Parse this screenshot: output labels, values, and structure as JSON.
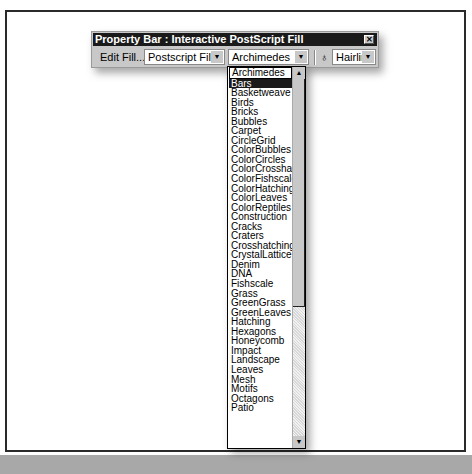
{
  "property_bar": {
    "title": "Property Bar : Interactive PostScript Fill",
    "close_glyph": "✕",
    "edit_fill_label": "Edit Fill...",
    "fill_type": {
      "value": "Postscript Fill",
      "arrow": "▼"
    },
    "pattern": {
      "value": "Archimedes",
      "arrow": "▼"
    },
    "outline_icon": "♁",
    "outline_width": {
      "value": "Hairline",
      "arrow": "▼"
    }
  },
  "dropdown": {
    "current": "Archimedes",
    "selected": "Bars",
    "scroll_up": "▲",
    "scroll_down": "▼",
    "items": [
      "Archimedes",
      "Bars",
      "Basketweave",
      "Birds",
      "Bricks",
      "Bubbles",
      "Carpet",
      "CircleGrid",
      "ColorBubbles",
      "ColorCircles",
      "ColorCrosshatch",
      "ColorFishscale",
      "ColorHatching",
      "ColorLeaves",
      "ColorReptiles",
      "Construction",
      "Cracks",
      "Craters",
      "Crosshatching",
      "CrystalLattice",
      "Denim",
      "DNA",
      "Fishscale",
      "Grass",
      "GreenGrass",
      "GreenLeaves",
      "Hatching",
      "Hexagons",
      "Honeycomb",
      "Impact",
      "Landscape",
      "Leaves",
      "Mesh",
      "Motifs",
      "Octagons",
      "Patio"
    ]
  }
}
